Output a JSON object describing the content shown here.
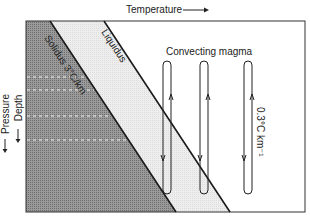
{
  "diagram": {
    "x_axis_label": "Temperature",
    "y_axis_label_outer": "Pressure",
    "y_axis_label_inner": "Depth",
    "solidus_label": "Solidus 3°C/km",
    "liquidus_label": "Liquidus",
    "convecting_label": "Convecting magma",
    "gradient_label": "0.3°C km⁻¹",
    "colors": {
      "solid_region": "#8a8a8a",
      "partial_melt_region": "#e4e4e4",
      "liquid_region": "#ffffff",
      "line": "#1a1a1a"
    },
    "convection_loops": 3
  }
}
